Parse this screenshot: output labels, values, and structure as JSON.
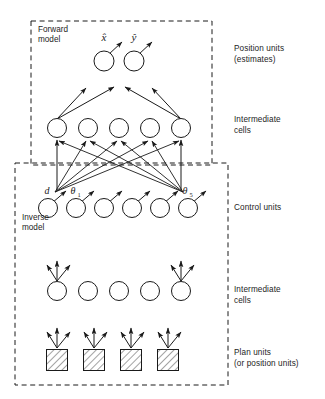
{
  "figure": {
    "background_color": "#ffffff",
    "stroke_color": "#1a1a1a",
    "hatch_color": "#8c8c8c"
  },
  "boxes": {
    "forward": {
      "label_line1": "Forward",
      "label_line2": "model",
      "x": 31,
      "y": 21,
      "width": 181,
      "height": 144
    },
    "inverse": {
      "label_line1": "Inverse",
      "label_line2": "model",
      "x": 15,
      "y": 163,
      "width": 213,
      "height": 222
    }
  },
  "row_labels": [
    {
      "line1": "Position units",
      "line2": "(estimates)",
      "x": 234,
      "y": 44
    },
    {
      "line1": "Intermediate",
      "line2": "cells",
      "x": 234,
      "y": 115
    },
    {
      "line1": "Control units",
      "line2": "",
      "x": 234,
      "y": 203
    },
    {
      "line1": "Intermediate",
      "line2": "cells",
      "x": 234,
      "y": 285
    },
    {
      "line1": "Plan units",
      "line2": "(or position units)",
      "x": 234,
      "y": 348
    }
  ],
  "unit_labels": {
    "x_hat": "x̂",
    "y_hat": "ŷ",
    "d": "d",
    "theta_1": "θ",
    "theta_1_sub": "1",
    "theta_5": "θ",
    "theta_5_sub": "5"
  },
  "layers": {
    "position_units": {
      "name": "position-units",
      "count": 2,
      "radius": 10,
      "cy": 61,
      "cx": [
        104,
        134
      ]
    },
    "intermediate_cells_top": {
      "name": "intermediate-cells-top",
      "count": 5,
      "radius": 9.5,
      "cy": 128,
      "cx": [
        57,
        88,
        119,
        150,
        181
      ]
    },
    "control_units": {
      "name": "control-units",
      "count": 6,
      "radius": 9.5,
      "cy": 208,
      "cx": [
        48,
        76,
        104,
        132,
        160,
        188
      ]
    },
    "intermediate_cells_bottom": {
      "name": "intermediate-cells-bottom",
      "count": 5,
      "radius": 9.5,
      "cy": 291,
      "cx": [
        57,
        88,
        119,
        150,
        181
      ]
    },
    "plan_units": {
      "name": "plan-units",
      "count": 4,
      "size": 21,
      "cy": 360,
      "cx": [
        57,
        94,
        131,
        168
      ],
      "fill": "hatched"
    }
  },
  "icons": {
    "forward_box": "dashed-rectangle-icon",
    "inverse_box": "dashed-rectangle-icon",
    "arrow": "arrow-icon",
    "circle_unit": "circle-node-icon",
    "square_unit": "hatched-square-node-icon"
  }
}
